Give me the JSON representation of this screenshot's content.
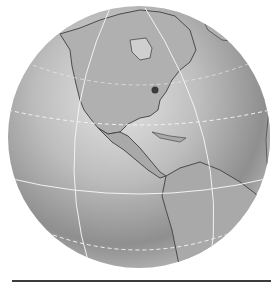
{
  "image": {
    "subject": "Grayscale globe showing the Americas",
    "marker": {
      "label": "location-dot",
      "color": "#3a3a3a"
    },
    "colors": {
      "background": "#ffffff",
      "ocean_light": "#d6d6d6",
      "ocean_dark": "#8a8a8a",
      "land": "#a9a9a9",
      "coast": "#4a4a4a",
      "gridline": "#f2f2f2",
      "baseline": "#3c3c3c"
    }
  }
}
